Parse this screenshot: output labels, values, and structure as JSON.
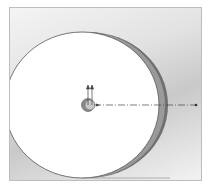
{
  "figure": {
    "colors": {
      "background_light": "#f4f4f4",
      "background_dark": "#c9c9c9",
      "disc_face": "#ffffff",
      "disc_rim": "#6e6e6e",
      "outline": "#555555",
      "axis_line": "#444444"
    },
    "annotations": []
  }
}
